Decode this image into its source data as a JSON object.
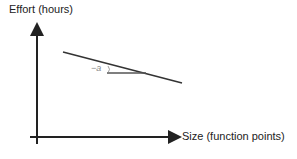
{
  "diagram": {
    "type": "effort-vs-size-slope",
    "y_axis": {
      "label": "Effort (hours)"
    },
    "x_axis": {
      "label": "Size (function points)"
    },
    "angle": {
      "label": "−a"
    },
    "colors": {
      "axis": "#222222",
      "line": "#333333",
      "angle_label": "#888888"
    },
    "geometry": {
      "origin": [
        37,
        137
      ],
      "y_axis_tip": [
        37,
        23
      ],
      "x_axis_tip": [
        181,
        137
      ],
      "sloped_line": [
        [
          63,
          52
        ],
        [
          182,
          83
        ]
      ],
      "reference_line": [
        [
          107,
          73
        ],
        [
          145,
          73
        ]
      ]
    }
  }
}
